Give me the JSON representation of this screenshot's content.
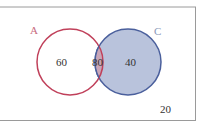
{
  "diagram": {
    "type": "venn",
    "sets": [
      {
        "label": "A",
        "only_value": "60",
        "stroke": "#c0405a"
      },
      {
        "label": "C",
        "only_value": "40",
        "stroke": "#4a5f9c",
        "fill": "#b9c3dc"
      }
    ],
    "intersection_value": "80",
    "intersection_fill": "#c9a6b8",
    "outside_value": "20",
    "frame_color": "#9a9a9a",
    "label_color": "#c86b7e",
    "label_c_color": "#8a98b8",
    "text_color": "#333333"
  }
}
